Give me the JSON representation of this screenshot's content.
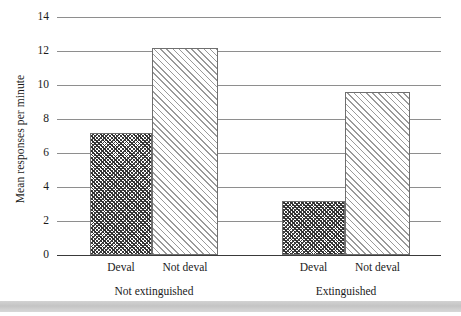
{
  "chart_data": {
    "type": "bar",
    "title": "",
    "xlabel": "",
    "ylabel": "Mean responses per minute",
    "ylim": [
      0,
      14
    ],
    "ytick_values": [
      0,
      2,
      4,
      6,
      8,
      10,
      12,
      14
    ],
    "ytick_labels": [
      "0",
      "2",
      "4",
      "6",
      "8",
      "10",
      "12",
      "14"
    ],
    "grid": true,
    "legend": "none",
    "groups": [
      {
        "label": "Not extinguished",
        "bars": [
          {
            "category": "Deval",
            "value": 7.2,
            "fill": "dark-crosshatch"
          },
          {
            "category": "Not deval",
            "value": 12.2,
            "fill": "light-hatch"
          }
        ]
      },
      {
        "label": "Extinguished",
        "bars": [
          {
            "category": "Deval",
            "value": 3.2,
            "fill": "dark-crosshatch"
          },
          {
            "category": "Not deval",
            "value": 9.6,
            "fill": "light-hatch"
          }
        ]
      }
    ],
    "categories": [
      "Deval",
      "Not deval",
      "Deval",
      "Not deval"
    ],
    "values": [
      7.2,
      12.2,
      3.2,
      9.6
    ],
    "colors": {
      "gridline": "#8e8e8e",
      "axis": "#3a3a3a",
      "bar_outline": "#6f6f6f",
      "dark_hatch": "#2e2e2e",
      "light_hatch": "#9a9a9a",
      "page_band": "#c4c4c4"
    }
  }
}
